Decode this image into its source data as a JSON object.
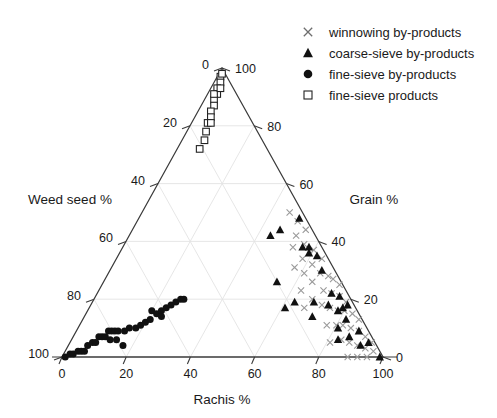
{
  "chart_data": {
    "type": "scatter",
    "plot_kind": "ternary",
    "title": "",
    "axes": {
      "bottom": {
        "label": "Rachis %",
        "ticks": [
          0,
          20,
          40,
          60,
          80,
          100
        ],
        "range": [
          0,
          100
        ]
      },
      "left": {
        "label": "Weed seed %",
        "ticks": [
          0,
          20,
          40,
          60,
          80,
          100
        ],
        "range": [
          0,
          100
        ]
      },
      "right": {
        "label": "Grain %",
        "ticks": [
          0,
          20,
          40,
          60,
          80,
          100
        ],
        "range": [
          0,
          100
        ]
      }
    },
    "grid": true,
    "legend_position": "top-right",
    "series": [
      {
        "name": "winnowing by-products",
        "marker": "cross",
        "color": "#9a9a9a",
        "points": [
          {
            "rachis": 46,
            "weed": 4,
            "grain": 50
          },
          {
            "rachis": 50,
            "weed": 3,
            "grain": 47
          },
          {
            "rachis": 52,
            "weed": 6,
            "grain": 42
          },
          {
            "rachis": 54,
            "weed": 2,
            "grain": 44
          },
          {
            "rachis": 56,
            "weed": 5,
            "grain": 39
          },
          {
            "rachis": 58,
            "weed": 8,
            "grain": 34
          },
          {
            "rachis": 60,
            "weed": 3,
            "grain": 37
          },
          {
            "rachis": 61,
            "weed": 10,
            "grain": 29
          },
          {
            "rachis": 62,
            "weed": 6,
            "grain": 32
          },
          {
            "rachis": 64,
            "weed": 2,
            "grain": 34
          },
          {
            "rachis": 65,
            "weed": 9,
            "grain": 26
          },
          {
            "rachis": 66,
            "weed": 5,
            "grain": 29
          },
          {
            "rachis": 68,
            "weed": 12,
            "grain": 20
          },
          {
            "rachis": 69,
            "weed": 3,
            "grain": 28
          },
          {
            "rachis": 70,
            "weed": 7,
            "grain": 23
          },
          {
            "rachis": 71,
            "weed": 2,
            "grain": 27
          },
          {
            "rachis": 72,
            "weed": 10,
            "grain": 18
          },
          {
            "rachis": 73,
            "weed": 5,
            "grain": 22
          },
          {
            "rachis": 74,
            "weed": 1,
            "grain": 25
          },
          {
            "rachis": 75,
            "weed": 8,
            "grain": 17
          },
          {
            "rachis": 76,
            "weed": 3,
            "grain": 21
          },
          {
            "rachis": 77,
            "weed": 12,
            "grain": 11
          },
          {
            "rachis": 78,
            "weed": 6,
            "grain": 16
          },
          {
            "rachis": 79,
            "weed": 2,
            "grain": 19
          },
          {
            "rachis": 80,
            "weed": 9,
            "grain": 11
          },
          {
            "rachis": 80,
            "weed": 4,
            "grain": 16
          },
          {
            "rachis": 81,
            "weed": 14,
            "grain": 5
          },
          {
            "rachis": 82,
            "weed": 7,
            "grain": 11
          },
          {
            "rachis": 83,
            "weed": 2,
            "grain": 15
          },
          {
            "rachis": 84,
            "weed": 10,
            "grain": 6
          },
          {
            "rachis": 85,
            "weed": 5,
            "grain": 10
          },
          {
            "rachis": 86,
            "weed": 1,
            "grain": 13
          },
          {
            "rachis": 87,
            "weed": 8,
            "grain": 5
          },
          {
            "rachis": 88,
            "weed": 3,
            "grain": 9
          },
          {
            "rachis": 89,
            "weed": 11,
            "grain": 0
          },
          {
            "rachis": 90,
            "weed": 6,
            "grain": 4
          },
          {
            "rachis": 91,
            "weed": 2,
            "grain": 7
          },
          {
            "rachis": 92,
            "weed": 8,
            "grain": 0
          },
          {
            "rachis": 93,
            "weed": 4,
            "grain": 3
          },
          {
            "rachis": 94,
            "weed": 1,
            "grain": 5
          },
          {
            "rachis": 95,
            "weed": 5,
            "grain": 0
          },
          {
            "rachis": 96,
            "weed": 2,
            "grain": 2
          },
          {
            "rachis": 63,
            "weed": 14,
            "grain": 23
          },
          {
            "rachis": 57,
            "weed": 12,
            "grain": 31
          },
          {
            "rachis": 67,
            "weed": 16,
            "grain": 17
          },
          {
            "rachis": 53,
            "weed": 9,
            "grain": 38
          }
        ]
      },
      {
        "name": "coarse-sieve by-products",
        "marker": "triangle",
        "color": "#111111",
        "points": [
          {
            "rachis": 50,
            "weed": 2,
            "grain": 48
          },
          {
            "rachis": 56,
            "weed": 6,
            "grain": 38
          },
          {
            "rachis": 58,
            "weed": 4,
            "grain": 38
          },
          {
            "rachis": 59,
            "weed": 5,
            "grain": 36
          },
          {
            "rachis": 62,
            "weed": 3,
            "grain": 35
          },
          {
            "rachis": 66,
            "weed": 4,
            "grain": 30
          },
          {
            "rachis": 73,
            "weed": 5,
            "grain": 22
          },
          {
            "rachis": 74,
            "weed": 8,
            "grain": 18
          },
          {
            "rachis": 76,
            "weed": 3,
            "grain": 21
          },
          {
            "rachis": 78,
            "weed": 6,
            "grain": 16
          },
          {
            "rachis": 79,
            "weed": 4,
            "grain": 17
          },
          {
            "rachis": 80,
            "weed": 2,
            "grain": 18
          },
          {
            "rachis": 81,
            "weed": 9,
            "grain": 10
          },
          {
            "rachis": 82,
            "weed": 5,
            "grain": 13
          },
          {
            "rachis": 83,
            "weed": 11,
            "grain": 6
          },
          {
            "rachis": 69,
            "weed": 12,
            "grain": 19
          },
          {
            "rachis": 71,
            "weed": 15,
            "grain": 14
          },
          {
            "rachis": 63,
            "weed": 18,
            "grain": 19
          },
          {
            "rachis": 86,
            "weed": 7,
            "grain": 7
          },
          {
            "rachis": 88,
            "weed": 3,
            "grain": 9
          },
          {
            "rachis": 91,
            "weed": 5,
            "grain": 4
          },
          {
            "rachis": 93,
            "weed": 2,
            "grain": 5
          },
          {
            "rachis": 99,
            "weed": 1,
            "grain": 0
          },
          {
            "rachis": 46,
            "weed": 10,
            "grain": 44
          },
          {
            "rachis": 54,
            "weed": 20,
            "grain": 26
          },
          {
            "rachis": 61,
            "weed": 22,
            "grain": 17
          },
          {
            "rachis": 44,
            "weed": 14,
            "grain": 42
          }
        ]
      },
      {
        "name": "fine-sieve by-products",
        "marker": "circle",
        "color": "#111111",
        "points": [
          {
            "rachis": 1,
            "weed": 99,
            "grain": 0
          },
          {
            "rachis": 2,
            "weed": 97,
            "grain": 1
          },
          {
            "rachis": 3,
            "weed": 96,
            "grain": 1
          },
          {
            "rachis": 4,
            "weed": 94,
            "grain": 2
          },
          {
            "rachis": 5,
            "weed": 93,
            "grain": 2
          },
          {
            "rachis": 6,
            "weed": 90,
            "grain": 4
          },
          {
            "rachis": 7,
            "weed": 88,
            "grain": 5
          },
          {
            "rachis": 8,
            "weed": 87,
            "grain": 5
          },
          {
            "rachis": 8,
            "weed": 85,
            "grain": 7
          },
          {
            "rachis": 9,
            "weed": 84,
            "grain": 7
          },
          {
            "rachis": 10,
            "weed": 83,
            "grain": 7
          },
          {
            "rachis": 10,
            "weed": 81,
            "grain": 9
          },
          {
            "rachis": 11,
            "weed": 80,
            "grain": 9
          },
          {
            "rachis": 12,
            "weed": 79,
            "grain": 9
          },
          {
            "rachis": 13,
            "weed": 78,
            "grain": 9
          },
          {
            "rachis": 14,
            "weed": 80,
            "grain": 6
          },
          {
            "rachis": 17,
            "weed": 79,
            "grain": 4
          },
          {
            "rachis": 16,
            "weed": 74,
            "grain": 10
          },
          {
            "rachis": 18,
            "weed": 72,
            "grain": 10
          },
          {
            "rachis": 19,
            "weed": 70,
            "grain": 11
          },
          {
            "rachis": 20,
            "weed": 68,
            "grain": 12
          },
          {
            "rachis": 21,
            "weed": 66,
            "grain": 13
          },
          {
            "rachis": 20,
            "weed": 64,
            "grain": 16
          },
          {
            "rachis": 22,
            "weed": 63,
            "grain": 15
          },
          {
            "rachis": 23,
            "weed": 61,
            "grain": 16
          },
          {
            "rachis": 24,
            "weed": 59,
            "grain": 17
          },
          {
            "rachis": 25,
            "weed": 57,
            "grain": 18
          },
          {
            "rachis": 26,
            "weed": 55,
            "grain": 19
          },
          {
            "rachis": 27,
            "weed": 53,
            "grain": 20
          },
          {
            "rachis": 28,
            "weed": 52,
            "grain": 20
          },
          {
            "rachis": 6,
            "weed": 92,
            "grain": 2
          },
          {
            "rachis": 12,
            "weed": 82,
            "grain": 6
          },
          {
            "rachis": 15,
            "weed": 76,
            "grain": 9
          },
          {
            "rachis": 24,
            "weed": 62,
            "grain": 14
          }
        ]
      },
      {
        "name": "fine-sieve products",
        "marker": "square",
        "color": "#222222",
        "points": [
          {
            "rachis": 1,
            "weed": 2,
            "grain": 97
          },
          {
            "rachis": 2,
            "weed": 3,
            "grain": 95
          },
          {
            "rachis": 2,
            "weed": 5,
            "grain": 93
          },
          {
            "rachis": 3,
            "weed": 6,
            "grain": 91
          },
          {
            "rachis": 3,
            "weed": 8,
            "grain": 89
          },
          {
            "rachis": 4,
            "weed": 9,
            "grain": 87
          },
          {
            "rachis": 4,
            "weed": 11,
            "grain": 85
          },
          {
            "rachis": 5,
            "weed": 12,
            "grain": 83
          },
          {
            "rachis": 5,
            "weed": 14,
            "grain": 81
          },
          {
            "rachis": 6,
            "weed": 16,
            "grain": 78
          },
          {
            "rachis": 7,
            "weed": 18,
            "grain": 75
          },
          {
            "rachis": 7,
            "weed": 21,
            "grain": 72
          },
          {
            "rachis": 1,
            "weed": 1,
            "grain": 98
          },
          {
            "rachis": 2,
            "weed": 7,
            "grain": 91
          },
          {
            "rachis": 3,
            "weed": 4,
            "grain": 93
          },
          {
            "rachis": 6,
            "weed": 13,
            "grain": 81
          }
        ]
      }
    ]
  },
  "legend": {
    "items": [
      {
        "label": "winnowing by-products",
        "marker": "cross"
      },
      {
        "label": "coarse-sieve by-products",
        "marker": "triangle"
      },
      {
        "label": "fine-sieve by-products",
        "marker": "circle"
      },
      {
        "label": "fine-sieve products",
        "marker": "square"
      }
    ]
  },
  "axis_titles": {
    "bottom": "Rachis %",
    "left": "Weed seed %",
    "right": "Grain %"
  },
  "tick_labels": {
    "bottom": [
      "0",
      "20",
      "40",
      "60",
      "80",
      "100"
    ],
    "left": [
      "0",
      "20",
      "40",
      "60",
      "80",
      "100"
    ],
    "right": [
      "100",
      "80",
      "60",
      "40",
      "20",
      "0"
    ]
  }
}
